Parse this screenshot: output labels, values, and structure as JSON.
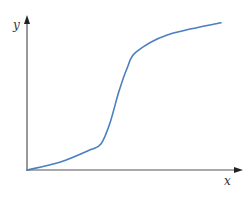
{
  "chart_data": {
    "type": "line",
    "title": "",
    "xlabel": "x",
    "ylabel": "y",
    "grid": false,
    "legend": "none",
    "xlim": [
      0,
      1
    ],
    "ylim": [
      0,
      1
    ],
    "series": [
      {
        "name": "curve",
        "color": "#4a7fc0",
        "x": [
          0.0,
          0.15,
          0.29,
          0.34,
          0.38,
          0.42,
          0.46,
          0.5,
          0.64,
          0.89
        ],
        "y": [
          0.0,
          0.05,
          0.13,
          0.17,
          0.3,
          0.5,
          0.66,
          0.76,
          0.87,
          0.95
        ]
      }
    ]
  },
  "colors": {
    "axis": "#555555",
    "curve": "#4a7fc0"
  }
}
